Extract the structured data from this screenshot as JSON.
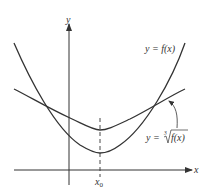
{
  "diagram": {
    "type": "function-graph",
    "axes": {
      "x_label": "x",
      "y_label": "y"
    },
    "curves": [
      {
        "name": "f",
        "label": "y = f(x)",
        "shape": "steep parabola with minimum at x0"
      },
      {
        "name": "cube-root-f",
        "label": "y = ∛(f(x))",
        "shape": "flatter curve with minimum at x0, intersects f at two points"
      }
    ],
    "marker": {
      "label_main": "x",
      "label_sub": "0",
      "style": "dashed vertical line"
    },
    "labels": {
      "f_prefix": "y = f(x)",
      "root_prefix": "y = ",
      "root_index": "3",
      "root_body": "f(x)"
    },
    "colors": {
      "stroke": "#333333",
      "background": "#ffffff"
    }
  }
}
